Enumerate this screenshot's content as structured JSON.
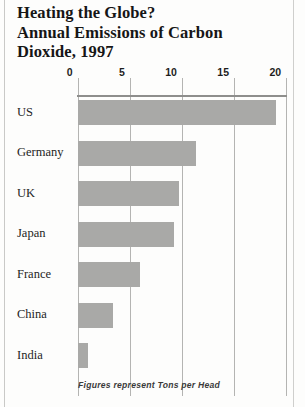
{
  "title": {
    "line1": "Heating the Globe?",
    "line2": "Annual Emissions of Carbon",
    "line3": "Dioxide, 1997"
  },
  "footnote": "Figures represent Tons per Head",
  "colors": {
    "bar": "#a9a9a7",
    "gridline": "#b4b4b2",
    "axis": "#8e8e8c",
    "text": "#1d1d1d",
    "page_rule": "#c9c9c7"
  },
  "chart_data": {
    "type": "bar",
    "orientation": "horizontal",
    "title": "Heating the Globe? Annual Emissions of Carbon Dioxide, 1997",
    "xlabel": "",
    "ylabel": "",
    "unit": "Tons per Head",
    "xlim": [
      0,
      20
    ],
    "xticks": [
      0,
      5,
      10,
      15,
      20
    ],
    "xticklabels": [
      "0",
      "5",
      "10",
      "15",
      "20"
    ],
    "grid": true,
    "legend": false,
    "categories": [
      "US",
      "Germany",
      "UK",
      "Japan",
      "France",
      "China",
      "India"
    ],
    "values": [
      19.0,
      11.4,
      9.7,
      9.2,
      6.0,
      3.4,
      1.0
    ],
    "annotations": [
      "Figures represent Tons per Head"
    ]
  },
  "axis_ticks": [
    {
      "label": "0",
      "value": 0
    },
    {
      "label": "5",
      "value": 5
    },
    {
      "label": "10",
      "value": 10
    },
    {
      "label": "15",
      "value": 15
    },
    {
      "label": "20",
      "value": 20
    }
  ],
  "rows": [
    {
      "label": "US",
      "value": 19.0
    },
    {
      "label": "Germany",
      "value": 11.4
    },
    {
      "label": "UK",
      "value": 9.7
    },
    {
      "label": "Japan",
      "value": 9.2
    },
    {
      "label": "France",
      "value": 6.0
    },
    {
      "label": "China",
      "value": 3.4
    },
    {
      "label": "India",
      "value": 1.0
    }
  ]
}
